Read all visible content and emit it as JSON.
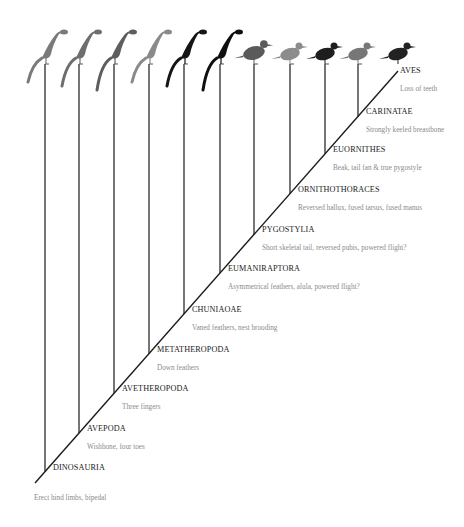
{
  "diagram": {
    "type": "cladogram",
    "colors": {
      "branch": "#1a1a1a",
      "clade_name": "#1a1a1a",
      "trait_text": "#8a8a8a",
      "background": "#ffffff"
    },
    "taxa_icons": [
      {
        "name": "basal-dinosaur-silhouette",
        "shade": "#7a7a7a"
      },
      {
        "name": "early-theropod-silhouette",
        "shade": "#6e6e6e"
      },
      {
        "name": "avetheropod-silhouette",
        "shade": "#5e5e5e"
      },
      {
        "name": "feathered-coelurosaur-silhouette",
        "shade": "#8a8a8a"
      },
      {
        "name": "pennaraptoran-silhouette",
        "shade": "#151515"
      },
      {
        "name": "paravian-silhouette",
        "shade": "#0f0f0f"
      },
      {
        "name": "pigeon-silhouette",
        "shade": "#5a5a5a"
      },
      {
        "name": "gull-silhouette",
        "shade": "#8c8c8c"
      },
      {
        "name": "magpie-silhouette",
        "shade": "#1e1e1e"
      },
      {
        "name": "tern-silhouette",
        "shade": "#777777"
      },
      {
        "name": "stilt-silhouette",
        "shade": "#222222"
      }
    ],
    "clades": [
      {
        "name": "DINOSAURIA",
        "trait": "Erect hind limbs, bipedal"
      },
      {
        "name": "AVEPODA",
        "trait": "Wishbone, four toes"
      },
      {
        "name": "AVETHEROPODA",
        "trait": "Three fingers"
      },
      {
        "name": "METATHEROPODA",
        "trait": "Down feathers"
      },
      {
        "name": "CHUNIAOAE",
        "trait": "Vaned feathers, nest brooding"
      },
      {
        "name": "EUMANIRAPTORA",
        "trait": "Asymmetrical feathers, alula, powered flight?"
      },
      {
        "name": "PYGOSTYLIA",
        "trait": "Short skeletal tail, reversed pubis, powered flight?"
      },
      {
        "name": "ORNITHOTHORACES",
        "trait": "Reversed hallux, fused tarsus, fused manus"
      },
      {
        "name": "EUORNITHES",
        "trait": "Beak, tail fan & true pygostyle"
      },
      {
        "name": "CARINATAE",
        "trait": "Strongly keeled breastbone"
      },
      {
        "name": "AVES",
        "trait": "Loss of teeth"
      }
    ]
  }
}
